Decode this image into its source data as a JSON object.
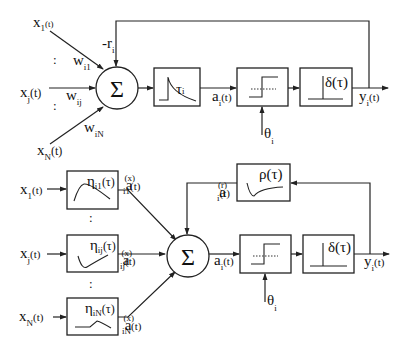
{
  "top_model": {
    "inputs": [
      {
        "var": "x",
        "sub": "1",
        "arg": "(t)",
        "weight": "w",
        "weight_sub": "i1"
      },
      {
        "var": "x",
        "sub": "j",
        "arg": "(t)",
        "weight": "w",
        "weight_sub": "ij"
      },
      {
        "var": "x",
        "sub": "N",
        "arg": "(t)",
        "weight": "w",
        "weight_sub": "iN"
      }
    ],
    "ellipsis": ":",
    "sum_symbol": "Σ",
    "reset": {
      "var": "-r",
      "sub": "i"
    },
    "kernel_box": {
      "label": "τ",
      "sub": "i",
      "shape": "decay"
    },
    "activation": {
      "var": "a",
      "sub": "i",
      "arg": "(t)"
    },
    "threshold_box": {
      "shape": "step"
    },
    "threshold": {
      "var": "θ",
      "sub": "i"
    },
    "spike_box": {
      "label": "δ(τ)",
      "shape": "impulse"
    },
    "output": {
      "var": "y",
      "sub": "i",
      "arg": "(t)"
    }
  },
  "bottom_model": {
    "inputs": [
      {
        "var": "x",
        "sub": "1",
        "arg": "(t)",
        "kernel": "η",
        "kernel_sub": "i1",
        "kernel_arg": "(τ)",
        "out_var": "a",
        "out_sup": "(x)",
        "out_sub": "i1",
        "out_arg": "(t)",
        "shape": "alpha"
      },
      {
        "var": "x",
        "sub": "j",
        "arg": "(t)",
        "kernel": "η",
        "kernel_sub": "ij",
        "kernel_arg": "(τ)",
        "out_var": "a",
        "out_sup": "(x)",
        "out_sub": "ij",
        "out_arg": "(t)",
        "shape": "inhibitory"
      },
      {
        "var": "x",
        "sub": "N",
        "arg": "(t)",
        "kernel": "η",
        "kernel_sub": "iN",
        "kernel_arg": "(τ)",
        "out_var": "a",
        "out_sup": "(x)",
        "out_sub": "iN",
        "out_arg": "(t)",
        "shape": "delayed-decay"
      }
    ],
    "ellipsis": ":",
    "sum_symbol": "Σ",
    "refractory_box": {
      "label": "ρ(τ)",
      "shape": "refractory"
    },
    "refractory_out": {
      "var": "a",
      "sup": "(r)",
      "sub": "i",
      "arg": "(t)"
    },
    "activation": {
      "var": "a",
      "sub": "i",
      "arg": "(t)"
    },
    "threshold_box": {
      "shape": "step"
    },
    "threshold": {
      "var": "θ",
      "sub": "i"
    },
    "spike_box": {
      "label": "δ(τ)",
      "shape": "impulse"
    },
    "output": {
      "var": "y",
      "sub": "i",
      "arg": "(t)"
    }
  }
}
